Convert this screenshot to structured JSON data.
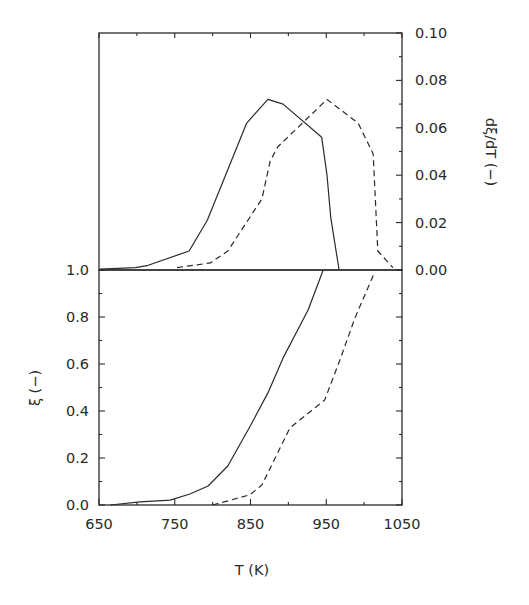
{
  "chart_data": [
    {
      "type": "line",
      "panel": "upper",
      "title": "",
      "xlabel": "T (K)",
      "ylabel": "dξ/dT (−)",
      "ylabel_side": "right",
      "xlim": [
        650,
        1050
      ],
      "ylim": [
        0.0,
        0.1
      ],
      "yticks": [
        "0.00",
        "0.02",
        "0.04",
        "0.06",
        "0.08",
        "0.10"
      ],
      "grid": false,
      "series": [
        {
          "name": "solid",
          "style": "solid",
          "x": [
            651,
            698,
            715,
            769,
            793,
            845,
            873,
            893,
            944,
            951,
            956,
            967
          ],
          "y": [
            0.0004,
            0.001,
            0.002,
            0.008,
            0.021,
            0.062,
            0.072,
            0.07,
            0.056,
            0.04,
            0.022,
            0.0
          ]
        },
        {
          "name": "dashed",
          "style": "dashed",
          "x": [
            753,
            797,
            820,
            865,
            876,
            886,
            951,
            992,
            1012,
            1018,
            1038
          ],
          "y": [
            0.001,
            0.003,
            0.008,
            0.03,
            0.046,
            0.052,
            0.072,
            0.062,
            0.049,
            0.008,
            0.001
          ]
        }
      ]
    },
    {
      "type": "line",
      "panel": "lower",
      "title": "",
      "xlabel": "T (K)",
      "ylabel": "ξ (−)",
      "ylabel_side": "left",
      "xlim": [
        650,
        1050
      ],
      "ylim": [
        0.0,
        1.0
      ],
      "xticks": [
        "650",
        "750",
        "850",
        "950",
        "1050"
      ],
      "yticks": [
        "0.0",
        "0.2",
        "0.4",
        "0.6",
        "0.8",
        "1.0"
      ],
      "grid": false,
      "series": [
        {
          "name": "solid",
          "style": "solid",
          "x": [
            665,
            704,
            744,
            770,
            794,
            820,
            849,
            873,
            893,
            926,
            946
          ],
          "y": [
            0.0,
            0.013,
            0.021,
            0.047,
            0.081,
            0.166,
            0.332,
            0.477,
            0.626,
            0.83,
            1.0
          ]
        },
        {
          "name": "dashed",
          "style": "dashed",
          "x": [
            800,
            849,
            865,
            902,
            948,
            968,
            988,
            1014
          ],
          "y": [
            0.0,
            0.043,
            0.085,
            0.328,
            0.447,
            0.617,
            0.796,
            0.991
          ]
        }
      ]
    }
  ],
  "labels": {
    "x_axis_title": "T (K)",
    "upper_y_axis_title": "dξ/dT  (−)",
    "lower_y_axis_title": "ξ  (−)"
  },
  "colors": {
    "ink": "#2a2a2a",
    "background": "#ffffff"
  }
}
